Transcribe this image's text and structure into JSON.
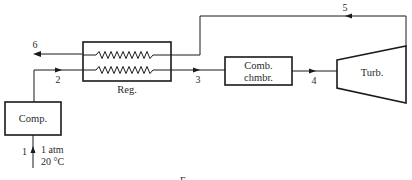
{
  "diagram": {
    "type": "regenerative gas turbine cycle schematic",
    "components": {
      "compressor": {
        "label": "Comp."
      },
      "regenerator": {
        "label": "Reg."
      },
      "combustion_chamber": {
        "label_line1": "Comb.",
        "label_line2": "chmbr."
      },
      "turbine": {
        "label": "Turb."
      }
    },
    "states": {
      "s1": "1",
      "s2": "2",
      "s3": "3",
      "s4": "4",
      "s5": "5",
      "s6": "6"
    },
    "inlet_conditions": {
      "pressure": "1 atm",
      "temperature": "20 °C"
    },
    "caption": "F"
  },
  "colors": {
    "line": "#1a1a1a",
    "text": "#2a2a2a",
    "background": "#ffffff"
  }
}
